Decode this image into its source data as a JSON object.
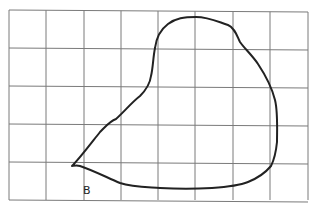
{
  "grid": {
    "columns": 8,
    "rows": 5,
    "x_lines": [
      9,
      46,
      84,
      121,
      158,
      195,
      233,
      270,
      308
    ],
    "y_lines": [
      10,
      48,
      86,
      124,
      162,
      200
    ],
    "line_color": "#7a7a7a",
    "line_width": 1
  },
  "shape": {
    "stroke_color": "#222222",
    "stroke_width": 2,
    "path": "M72,166 C80,158 92,142 100,132 C106,126 110,121 116,119 C124,112 132,102 140,96 C147,89 150,84 151,76 C153,68 153,58 155,48 C156,40 160,30 168,24 C176,18 184,17 196,17 C208,17 216,21 228,25 C235,28 237,36 240,42 C244,48 252,55 258,64 C266,76 272,88 275,100 C278,112 277,130 277,142 C276,152 274,160 271,166 C266,172 258,178 248,182 C238,186 226,187 212,188 C196,189 176,189 160,188 C146,187 132,187 120,183 C106,177 92,170 80,166 C76,165 73,166 72,166"
  },
  "labels": {
    "point_b": "B"
  }
}
